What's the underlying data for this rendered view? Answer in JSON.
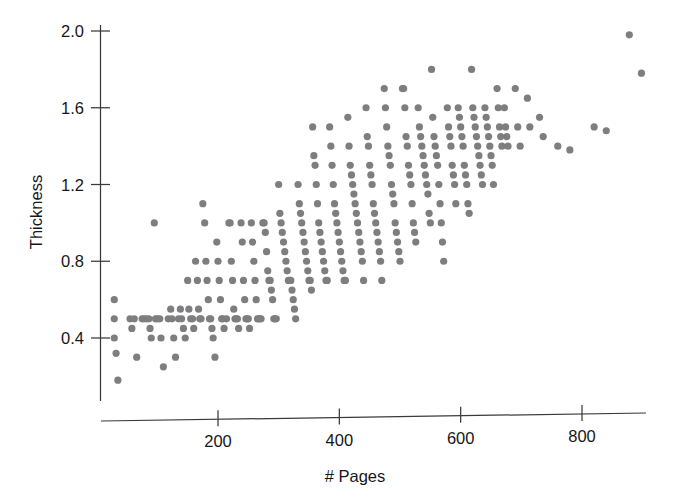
{
  "chart_data": {
    "type": "scatter",
    "title": "",
    "xlabel": "# Pages",
    "ylabel": "Thickness",
    "xlim": [
      0,
      920
    ],
    "ylim": [
      0.14,
      2.06
    ],
    "grid": false,
    "legend": null,
    "marker": {
      "shape": "circle",
      "color": "#7e7e80",
      "radius_px": 3.6
    },
    "x_ticks": [
      200,
      400,
      600,
      800
    ],
    "x_tick_labels": [
      "200",
      "400",
      "600",
      "800"
    ],
    "y_ticks": [
      0.4,
      0.8,
      1.2,
      1.6,
      2.0
    ],
    "y_tick_labels": [
      "0.4",
      "0.8",
      "1.2",
      "1.6",
      "2.0"
    ],
    "n_points": 298,
    "points": [
      [
        29,
        0.6
      ],
      [
        29,
        0.5
      ],
      [
        29,
        0.4
      ],
      [
        32,
        0.32
      ],
      [
        35,
        0.18
      ],
      [
        55,
        0.5
      ],
      [
        58,
        0.45
      ],
      [
        62,
        0.5
      ],
      [
        66,
        0.3
      ],
      [
        75,
        0.5
      ],
      [
        78,
        0.5
      ],
      [
        82,
        0.5
      ],
      [
        86,
        0.5
      ],
      [
        88,
        0.45
      ],
      [
        90,
        0.4
      ],
      [
        95,
        1.0
      ],
      [
        97,
        0.5
      ],
      [
        100,
        0.5
      ],
      [
        104,
        0.5
      ],
      [
        106,
        0.4
      ],
      [
        110,
        0.25
      ],
      [
        118,
        0.5
      ],
      [
        122,
        0.55
      ],
      [
        124,
        0.5
      ],
      [
        127,
        0.4
      ],
      [
        130,
        0.3
      ],
      [
        135,
        0.5
      ],
      [
        138,
        0.55
      ],
      [
        140,
        0.5
      ],
      [
        143,
        0.45
      ],
      [
        146,
        0.4
      ],
      [
        150,
        0.7
      ],
      [
        152,
        0.55
      ],
      [
        155,
        0.5
      ],
      [
        158,
        0.5
      ],
      [
        160,
        0.45
      ],
      [
        163,
        0.8
      ],
      [
        166,
        0.7
      ],
      [
        168,
        0.55
      ],
      [
        170,
        0.5
      ],
      [
        172,
        0.5
      ],
      [
        175,
        1.1
      ],
      [
        178,
        1.0
      ],
      [
        180,
        0.8
      ],
      [
        182,
        0.7
      ],
      [
        184,
        0.6
      ],
      [
        186,
        0.5
      ],
      [
        188,
        0.5
      ],
      [
        190,
        0.45
      ],
      [
        192,
        0.4
      ],
      [
        195,
        0.3
      ],
      [
        198,
        0.9
      ],
      [
        200,
        0.8
      ],
      [
        202,
        0.7
      ],
      [
        204,
        0.6
      ],
      [
        206,
        0.5
      ],
      [
        208,
        0.5
      ],
      [
        210,
        0.45
      ],
      [
        214,
        0.5
      ],
      [
        218,
        1.0
      ],
      [
        220,
        1.0
      ],
      [
        222,
        0.8
      ],
      [
        224,
        0.7
      ],
      [
        226,
        0.55
      ],
      [
        228,
        0.5
      ],
      [
        230,
        0.5
      ],
      [
        232,
        0.5
      ],
      [
        234,
        0.45
      ],
      [
        238,
        1.0
      ],
      [
        240,
        0.9
      ],
      [
        242,
        0.7
      ],
      [
        244,
        0.6
      ],
      [
        246,
        0.5
      ],
      [
        248,
        0.5
      ],
      [
        250,
        0.5
      ],
      [
        252,
        0.45
      ],
      [
        255,
        1.0
      ],
      [
        257,
        0.9
      ],
      [
        259,
        0.8
      ],
      [
        261,
        0.7
      ],
      [
        263,
        0.6
      ],
      [
        265,
        0.5
      ],
      [
        267,
        0.5
      ],
      [
        269,
        0.5
      ],
      [
        271,
        0.5
      ],
      [
        274,
        1.0
      ],
      [
        276,
        1.0
      ],
      [
        278,
        0.95
      ],
      [
        280,
        0.85
      ],
      [
        282,
        0.75
      ],
      [
        284,
        0.7
      ],
      [
        286,
        0.7
      ],
      [
        288,
        0.65
      ],
      [
        290,
        0.6
      ],
      [
        292,
        0.5
      ],
      [
        294,
        0.5
      ],
      [
        296,
        0.5
      ],
      [
        300,
        1.2
      ],
      [
        302,
        1.05
      ],
      [
        304,
        1.0
      ],
      [
        306,
        0.95
      ],
      [
        308,
        0.9
      ],
      [
        310,
        0.85
      ],
      [
        312,
        0.8
      ],
      [
        314,
        0.75
      ],
      [
        316,
        0.7
      ],
      [
        318,
        0.7
      ],
      [
        320,
        0.7
      ],
      [
        322,
        0.65
      ],
      [
        324,
        0.6
      ],
      [
        326,
        0.55
      ],
      [
        328,
        0.5
      ],
      [
        332,
        1.2
      ],
      [
        334,
        1.1
      ],
      [
        336,
        1.05
      ],
      [
        338,
        1.0
      ],
      [
        340,
        0.95
      ],
      [
        342,
        0.9
      ],
      [
        344,
        0.85
      ],
      [
        346,
        0.8
      ],
      [
        348,
        0.75
      ],
      [
        350,
        0.7
      ],
      [
        352,
        0.7
      ],
      [
        354,
        0.65
      ],
      [
        356,
        1.5
      ],
      [
        358,
        1.35
      ],
      [
        360,
        1.3
      ],
      [
        362,
        1.2
      ],
      [
        364,
        1.1
      ],
      [
        366,
        1.0
      ],
      [
        368,
        0.95
      ],
      [
        370,
        0.9
      ],
      [
        372,
        0.85
      ],
      [
        374,
        0.8
      ],
      [
        376,
        0.75
      ],
      [
        378,
        0.7
      ],
      [
        380,
        0.7
      ],
      [
        384,
        1.5
      ],
      [
        386,
        1.4
      ],
      [
        388,
        1.3
      ],
      [
        390,
        1.2
      ],
      [
        392,
        1.1
      ],
      [
        394,
        1.05
      ],
      [
        396,
        1.0
      ],
      [
        398,
        0.95
      ],
      [
        400,
        0.9
      ],
      [
        402,
        0.85
      ],
      [
        404,
        0.8
      ],
      [
        406,
        0.75
      ],
      [
        408,
        0.7
      ],
      [
        410,
        0.7
      ],
      [
        414,
        1.55
      ],
      [
        416,
        1.4
      ],
      [
        418,
        1.3
      ],
      [
        420,
        1.25
      ],
      [
        422,
        1.2
      ],
      [
        424,
        1.15
      ],
      [
        426,
        1.1
      ],
      [
        428,
        1.05
      ],
      [
        430,
        1.0
      ],
      [
        432,
        0.95
      ],
      [
        434,
        0.9
      ],
      [
        436,
        0.85
      ],
      [
        438,
        0.8
      ],
      [
        440,
        0.7
      ],
      [
        444,
        1.6
      ],
      [
        446,
        1.45
      ],
      [
        448,
        1.4
      ],
      [
        450,
        1.3
      ],
      [
        452,
        1.25
      ],
      [
        454,
        1.2
      ],
      [
        456,
        1.1
      ],
      [
        458,
        1.05
      ],
      [
        460,
        1.0
      ],
      [
        462,
        0.95
      ],
      [
        464,
        0.9
      ],
      [
        466,
        0.85
      ],
      [
        468,
        0.8
      ],
      [
        470,
        0.7
      ],
      [
        474,
        1.7
      ],
      [
        476,
        1.6
      ],
      [
        478,
        1.5
      ],
      [
        480,
        1.4
      ],
      [
        482,
        1.35
      ],
      [
        484,
        1.3
      ],
      [
        486,
        1.2
      ],
      [
        488,
        1.15
      ],
      [
        490,
        1.1
      ],
      [
        492,
        1.0
      ],
      [
        494,
        0.95
      ],
      [
        496,
        0.9
      ],
      [
        498,
        0.85
      ],
      [
        500,
        0.8
      ],
      [
        504,
        1.7
      ],
      [
        506,
        1.7
      ],
      [
        508,
        1.6
      ],
      [
        510,
        1.45
      ],
      [
        512,
        1.4
      ],
      [
        514,
        1.3
      ],
      [
        516,
        1.25
      ],
      [
        518,
        1.2
      ],
      [
        520,
        1.1
      ],
      [
        522,
        1.0
      ],
      [
        524,
        0.95
      ],
      [
        526,
        0.9
      ],
      [
        530,
        1.6
      ],
      [
        532,
        1.5
      ],
      [
        534,
        1.45
      ],
      [
        536,
        1.4
      ],
      [
        538,
        1.35
      ],
      [
        540,
        1.3
      ],
      [
        542,
        1.25
      ],
      [
        544,
        1.2
      ],
      [
        546,
        1.15
      ],
      [
        548,
        1.05
      ],
      [
        550,
        1.0
      ],
      [
        552,
        1.8
      ],
      [
        554,
        1.55
      ],
      [
        556,
        1.45
      ],
      [
        558,
        1.4
      ],
      [
        560,
        1.35
      ],
      [
        562,
        1.3
      ],
      [
        564,
        1.2
      ],
      [
        566,
        1.1
      ],
      [
        568,
        1.0
      ],
      [
        570,
        0.9
      ],
      [
        572,
        0.8
      ],
      [
        578,
        1.6
      ],
      [
        580,
        1.5
      ],
      [
        582,
        1.45
      ],
      [
        584,
        1.4
      ],
      [
        586,
        1.3
      ],
      [
        588,
        1.25
      ],
      [
        590,
        1.2
      ],
      [
        592,
        1.1
      ],
      [
        596,
        1.6
      ],
      [
        598,
        1.55
      ],
      [
        600,
        1.5
      ],
      [
        602,
        1.45
      ],
      [
        604,
        1.4
      ],
      [
        606,
        1.3
      ],
      [
        608,
        1.25
      ],
      [
        610,
        1.2
      ],
      [
        612,
        1.1
      ],
      [
        614,
        1.05
      ],
      [
        618,
        1.8
      ],
      [
        620,
        1.6
      ],
      [
        622,
        1.55
      ],
      [
        624,
        1.5
      ],
      [
        626,
        1.45
      ],
      [
        628,
        1.4
      ],
      [
        630,
        1.35
      ],
      [
        632,
        1.3
      ],
      [
        634,
        1.25
      ],
      [
        636,
        1.2
      ],
      [
        640,
        1.6
      ],
      [
        642,
        1.55
      ],
      [
        644,
        1.5
      ],
      [
        646,
        1.45
      ],
      [
        648,
        1.4
      ],
      [
        650,
        1.35
      ],
      [
        652,
        1.3
      ],
      [
        654,
        1.2
      ],
      [
        660,
        1.7
      ],
      [
        662,
        1.6
      ],
      [
        664,
        1.5
      ],
      [
        666,
        1.45
      ],
      [
        668,
        1.4
      ],
      [
        672,
        1.6
      ],
      [
        674,
        1.5
      ],
      [
        676,
        1.45
      ],
      [
        678,
        1.4
      ],
      [
        690,
        1.7
      ],
      [
        694,
        1.5
      ],
      [
        698,
        1.4
      ],
      [
        710,
        1.65
      ],
      [
        714,
        1.5
      ],
      [
        730,
        1.55
      ],
      [
        736,
        1.45
      ],
      [
        760,
        1.4
      ],
      [
        780,
        1.38
      ],
      [
        820,
        1.5
      ],
      [
        878,
        1.98
      ],
      [
        898,
        1.78
      ],
      [
        840,
        1.48
      ]
    ]
  },
  "axes": {
    "x_axis_name": "x-axis",
    "y_axis_name": "y-axis"
  }
}
